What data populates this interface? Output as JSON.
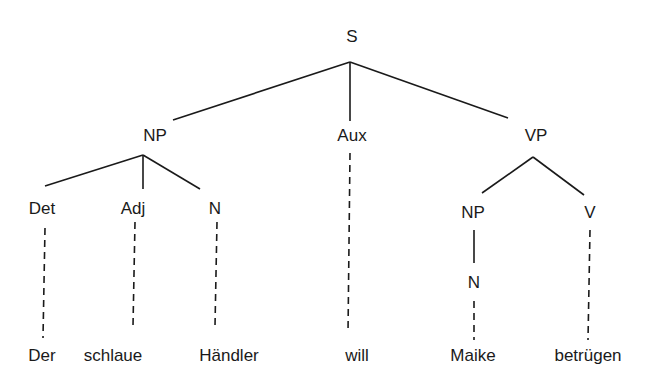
{
  "diagram": {
    "type": "syntax-tree",
    "nodes": {
      "s": "S",
      "np": "NP",
      "aux": "Aux",
      "vp": "VP",
      "det": "Det",
      "adj": "Adj",
      "n1": "N",
      "np2": "NP",
      "v": "V",
      "n2": "N"
    },
    "words": {
      "der": "Der",
      "schlaue": "schlaue",
      "haendler": "Händler",
      "will": "will",
      "maike": "Maike",
      "betruegen": "betrügen"
    },
    "edges": [
      {
        "from": "S",
        "to": "NP",
        "style": "solid"
      },
      {
        "from": "S",
        "to": "Aux",
        "style": "solid"
      },
      {
        "from": "S",
        "to": "VP",
        "style": "solid"
      },
      {
        "from": "NP",
        "to": "Det",
        "style": "solid"
      },
      {
        "from": "NP",
        "to": "Adj",
        "style": "solid"
      },
      {
        "from": "NP",
        "to": "N",
        "style": "solid"
      },
      {
        "from": "VP",
        "to": "NP",
        "style": "solid"
      },
      {
        "from": "VP",
        "to": "V",
        "style": "solid"
      },
      {
        "from": "NP",
        "to": "N",
        "style": "solid"
      },
      {
        "from": "Det",
        "to": "Der",
        "style": "dashed"
      },
      {
        "from": "Adj",
        "to": "schlaue",
        "style": "dashed"
      },
      {
        "from": "N",
        "to": "Händler",
        "style": "dashed"
      },
      {
        "from": "Aux",
        "to": "will",
        "style": "dashed"
      },
      {
        "from": "N",
        "to": "Maike",
        "style": "dashed"
      },
      {
        "from": "V",
        "to": "betrügen",
        "style": "dashed"
      }
    ]
  }
}
